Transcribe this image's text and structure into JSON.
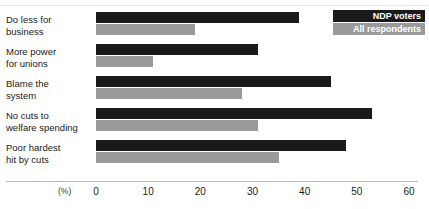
{
  "chart_data": {
    "type": "bar",
    "orientation": "horizontal",
    "title": "",
    "xlabel": "(%)",
    "ylabel": "",
    "xlim": [
      0,
      60
    ],
    "xticks": [
      0,
      10,
      20,
      30,
      40,
      50,
      60
    ],
    "xtick_labels": [
      "0",
      "10",
      "20",
      "30",
      "40",
      "50",
      "60"
    ],
    "grid": false,
    "legend_position": "top-right",
    "categories": [
      "Do less for\nbusiness",
      "More power\nfor unions",
      "Blame the\nsystem",
      "No cuts to\nwelfare spending",
      "Poor hardest\nhit by cuts"
    ],
    "series": [
      {
        "name": "NDP voters",
        "color": "#1a1a1a",
        "values": [
          39,
          31,
          45,
          53,
          48
        ]
      },
      {
        "name": "All respondents",
        "color": "#9a9a9a",
        "values": [
          19,
          11,
          28,
          31,
          35
        ]
      }
    ]
  },
  "axis": {
    "unit_label": "(%)"
  },
  "legend": {
    "items": [
      {
        "label": "NDP voters",
        "color": "#1a1a1a"
      },
      {
        "label": "All respondents",
        "color": "#9a9a9a"
      }
    ]
  }
}
